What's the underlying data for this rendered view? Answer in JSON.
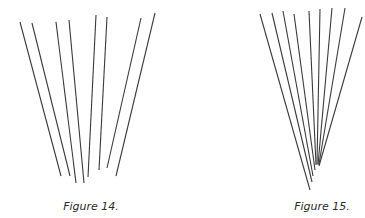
{
  "figures": [
    {
      "caption": "Figure 14.",
      "line_color": "#3a3a3a",
      "lines": [
        {
          "x1": 20,
          "y1": 22,
          "x2": 61,
          "y2": 176
        },
        {
          "x1": 32,
          "y1": 23,
          "x2": 70,
          "y2": 176
        },
        {
          "x1": 56,
          "y1": 22,
          "x2": 76,
          "y2": 183
        },
        {
          "x1": 69,
          "y1": 20,
          "x2": 84,
          "y2": 183
        },
        {
          "x1": 96,
          "y1": 15,
          "x2": 88,
          "y2": 177
        },
        {
          "x1": 107,
          "y1": 17,
          "x2": 99,
          "y2": 170
        },
        {
          "x1": 141,
          "y1": 18,
          "x2": 107,
          "y2": 168
        },
        {
          "x1": 155,
          "y1": 13,
          "x2": 116,
          "y2": 176
        }
      ]
    },
    {
      "caption": "Figure 15.",
      "line_color": "#3a3a3a",
      "lines": [
        {
          "x1": 260,
          "y1": 14,
          "x2": 310,
          "y2": 190
        },
        {
          "x1": 272,
          "y1": 13,
          "x2": 312,
          "y2": 182
        },
        {
          "x1": 283,
          "y1": 11,
          "x2": 313,
          "y2": 176
        },
        {
          "x1": 294,
          "y1": 14,
          "x2": 315,
          "y2": 170
        },
        {
          "x1": 309,
          "y1": 11,
          "x2": 316,
          "y2": 165
        },
        {
          "x1": 320,
          "y1": 9,
          "x2": 317,
          "y2": 164
        },
        {
          "x1": 332,
          "y1": 8,
          "x2": 318,
          "y2": 165
        },
        {
          "x1": 345,
          "y1": 8,
          "x2": 319,
          "y2": 164
        },
        {
          "x1": 362,
          "y1": 17,
          "x2": 319,
          "y2": 166
        }
      ]
    }
  ]
}
